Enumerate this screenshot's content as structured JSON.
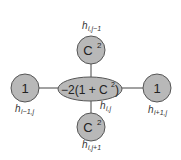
{
  "diagram": {
    "type": "finite-difference-stencil",
    "colors": {
      "node_fill": "#b8b8b8",
      "node_stroke": "#555555",
      "edge": "#444444",
      "text": "#222222"
    },
    "nodes": {
      "center": {
        "value": "−2(1 + C",
        "sup": "2",
        "close": ")",
        "label_base": "h",
        "label_sub": "i,j"
      },
      "top": {
        "value": "C",
        "sup": "2",
        "label_base": "h",
        "label_sub": "i,j−1"
      },
      "bottom": {
        "value": "C",
        "sup": "2",
        "label_base": "h",
        "label_sub": "i,j+1"
      },
      "left": {
        "value": "1",
        "label_base": "h",
        "label_sub": "i−1,j"
      },
      "right": {
        "value": "1",
        "label_base": "h",
        "label_sub": "i+1,j"
      }
    }
  }
}
